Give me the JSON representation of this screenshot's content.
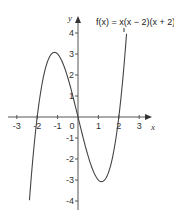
{
  "chart_data": {
    "type": "line",
    "title": "",
    "function_label": "f(x) = x(x − 2)(x + 2)",
    "xlabel": "x",
    "ylabel": "y",
    "xlim": [
      -3.4,
      3.5
    ],
    "ylim": [
      -4.3,
      4.6
    ],
    "x_ticks": [
      -3,
      -2,
      -1,
      0,
      1,
      2,
      3
    ],
    "x_tick_labels": [
      "-3",
      "-2",
      "-1",
      "0",
      "1",
      "2",
      "3"
    ],
    "y_ticks": [
      -4,
      -3,
      -2,
      -1,
      1,
      2,
      3,
      4
    ],
    "y_tick_labels": [
      "-4",
      "-3",
      "-2",
      "-1",
      "1",
      "2",
      "3",
      "4"
    ],
    "grid": false,
    "legend": "none",
    "series": [
      {
        "name": "f(x) = x(x − 2)(x + 2)",
        "x": [
          -2.38,
          -2.2,
          -2.0,
          -1.8,
          -1.6,
          -1.4,
          -1.15,
          -1.0,
          -0.8,
          -0.6,
          -0.4,
          -0.2,
          0.0,
          0.2,
          0.4,
          0.6,
          0.8,
          1.0,
          1.15,
          1.4,
          1.6,
          1.8,
          2.0,
          2.2,
          2.38
        ],
        "y": [
          -3.96,
          -1.85,
          0.0,
          1.37,
          2.3,
          2.86,
          3.08,
          3.0,
          2.69,
          2.18,
          1.54,
          0.79,
          0.0,
          -0.79,
          -1.54,
          -2.18,
          -2.69,
          -3.0,
          -3.08,
          -2.86,
          -2.3,
          -1.37,
          0.0,
          1.85,
          3.96
        ]
      }
    ]
  }
}
